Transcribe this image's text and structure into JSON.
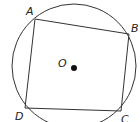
{
  "diagram": {
    "type": "inscribed-quadrilateral",
    "circle": {
      "center_label": "O",
      "cx": 74,
      "cy": 66,
      "r": 62
    },
    "vertices": [
      {
        "label": "A",
        "x": 35,
        "y": 19,
        "lx": 26,
        "ly": 15
      },
      {
        "label": "B",
        "x": 129,
        "y": 34,
        "lx": 131,
        "ly": 32
      },
      {
        "label": "C",
        "x": 121,
        "y": 111,
        "lx": 121,
        "ly": 123
      },
      {
        "label": "D",
        "x": 25,
        "y": 108,
        "lx": 15,
        "ly": 120
      }
    ],
    "center_point": {
      "x": 74,
      "y": 68,
      "label_x": 58,
      "label_y": 67
    },
    "stroke_color": "#333333"
  }
}
